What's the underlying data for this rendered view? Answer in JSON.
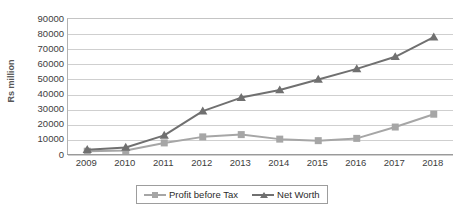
{
  "chart_data": {
    "type": "line",
    "title": "",
    "xlabel": "",
    "ylabel": "Rs million",
    "categories": [
      "2009",
      "2010",
      "2011",
      "2012",
      "2013",
      "2014",
      "2015",
      "2016",
      "2017",
      "2018"
    ],
    "ylim": [
      0,
      90000
    ],
    "ytick_step": 10000,
    "yticks": [
      "90000",
      "80000",
      "70000",
      "60000",
      "50000",
      "40000",
      "30000",
      "20000",
      "10000",
      "0"
    ],
    "ytick_values": [
      90000,
      80000,
      70000,
      60000,
      50000,
      40000,
      30000,
      20000,
      10000,
      0
    ],
    "grid": true,
    "legend_position": "bottom",
    "series": [
      {
        "name": "Profit before Tax",
        "marker": "square",
        "color": "#a6a6a6",
        "values": [
          2500,
          3000,
          8000,
          12000,
          13500,
          10500,
          9500,
          11000,
          18500,
          27000
        ]
      },
      {
        "name": "Net Worth",
        "marker": "triangle",
        "color": "#707070",
        "values": [
          3500,
          5000,
          13000,
          29000,
          38000,
          43000,
          50000,
          57000,
          65000,
          78000
        ]
      }
    ]
  },
  "axis": {
    "y_title": "Rs million"
  },
  "legend": {
    "items": [
      {
        "label": "Profit before Tax"
      },
      {
        "label": "Net Worth"
      }
    ]
  }
}
